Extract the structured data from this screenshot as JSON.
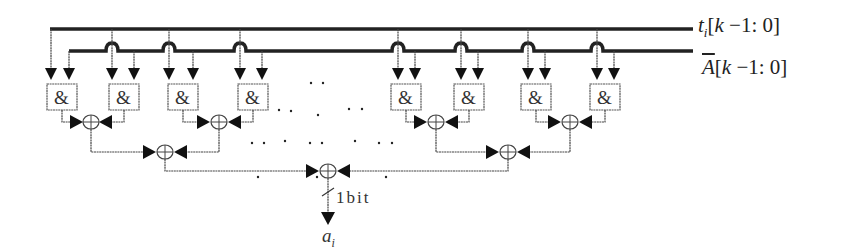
{
  "diagram": {
    "type": "logic-circuit",
    "buses": [
      {
        "name": "t_i",
        "label_main": "t",
        "label_sub": "i",
        "label_range": "[k −1: 0]"
      },
      {
        "name": "A_bar",
        "label_main": "A",
        "label_range": "[k −1: 0]",
        "overline": true
      }
    ],
    "and_gate_symbol": "&",
    "and_gate_count_visible": 8,
    "xor_symbol": "⊕",
    "output_width_label": "1bit",
    "output_label_main": "a",
    "output_label_sub": "i",
    "ellipsis": "· ·"
  }
}
